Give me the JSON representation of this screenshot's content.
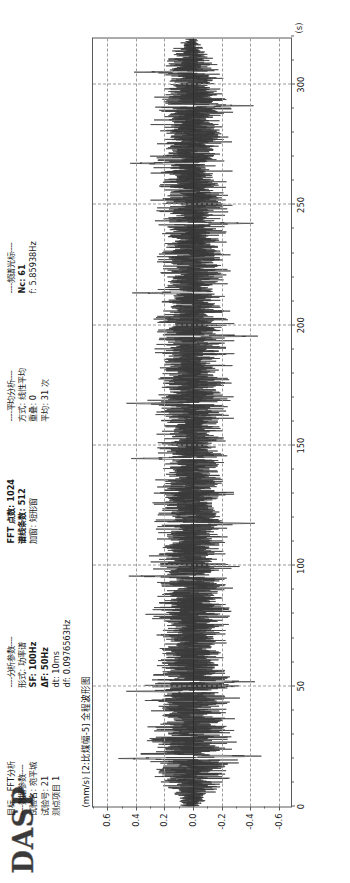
{
  "app": {
    "logo": "DASP",
    "mode_label": "目标 - FFT分析"
  },
  "params": {
    "data_section": "----数据参数----",
    "rows": [
      {
        "key": "试验名",
        "sep": ":",
        "value": "宛平城"
      },
      {
        "key": "试验号",
        "sep": ":",
        "value": "21"
      },
      {
        "key": "测点项目",
        "sep": "",
        "value": "1"
      }
    ],
    "analysis_section": "----分析参数----",
    "analysis_rows": [
      {
        "key": "形式",
        "sep": ":",
        "value": "功率谱",
        "bold": false
      },
      {
        "key": "SF",
        "sep": ":",
        "value": "100Hz",
        "bold": true
      },
      {
        "key": "ΔF",
        "sep": ":",
        "value": "50Hz",
        "bold": true
      },
      {
        "key": "dt",
        "sep": ":",
        "value": "10ms",
        "bold": false
      },
      {
        "key": "df",
        "sep": ":",
        "value": "0.0976563Hz",
        "bold": false
      },
      {
        "key": "FFT 点数",
        "sep": ":",
        "value": "1024",
        "bold": true
      },
      {
        "key": "谱线条数",
        "sep": ":",
        "value": "512",
        "bold": true
      },
      {
        "key": "加窗",
        "sep": ":",
        "value": "短形窗",
        "bold": false
      }
    ],
    "average_section": "----平均分析----",
    "average_rows": [
      {
        "key": "方式",
        "sep": ":",
        "value": "线性平均"
      },
      {
        "key": "重叠",
        "sep": ":",
        "value": "0"
      },
      {
        "key": "平均",
        "sep": ":",
        "value": "31 次"
      }
    ],
    "cursor_section": "----频谱光标----",
    "cursor_rows": [
      {
        "key": "Nc",
        "sep": ":",
        "value": "61"
      },
      {
        "key": "f",
        "sep": ":",
        "value": "5.85938Hz"
      }
    ]
  },
  "chart_data": {
    "type": "line",
    "title": "(mm/s) [2:比煤幅-5] 全程波形图",
    "xlabel": "",
    "xunit": "(s)",
    "ylabel": "",
    "yunit": "mm/s",
    "channel": "2:比煤幅-5",
    "xlim": [
      0,
      320
    ],
    "ylim": [
      -0.7,
      0.7
    ],
    "xticks": [
      0,
      50,
      100,
      150,
      200,
      250,
      300
    ],
    "xticklabels": [
      "0",
      "50",
      "100",
      "150",
      "200",
      "250",
      "300"
    ],
    "yticks": [
      -0.6,
      -0.4,
      -0.2,
      0.0,
      0.2,
      0.4,
      0.6
    ],
    "yticklabels": [
      "-0.6",
      "-0.4",
      "-0.2",
      "0.0",
      "0.2",
      "0.4",
      "0.6"
    ],
    "xminorstep": 10,
    "yminorstep": 0.1,
    "grid": true,
    "grid_style": "dashed",
    "legend": null,
    "series": [
      {
        "name": "2:比煤幅-5",
        "color": "#3b3b3b",
        "description": "dense random vibration time history, ~32000 samples at dt=10ms",
        "envelope_note": "amplitude envelope mostly within ±0.30 mm/s, occasional spikes to ±0.55",
        "envelope_x": [
          0,
          10,
          20,
          30,
          40,
          50,
          60,
          70,
          80,
          90,
          100,
          110,
          120,
          130,
          140,
          150,
          160,
          170,
          180,
          190,
          200,
          210,
          220,
          230,
          240,
          250,
          260,
          270,
          280,
          290,
          300,
          310,
          320
        ],
        "envelope_upper": [
          0.1,
          0.3,
          0.44,
          0.4,
          0.36,
          0.42,
          0.34,
          0.31,
          0.36,
          0.33,
          0.38,
          0.3,
          0.33,
          0.36,
          0.31,
          0.3,
          0.34,
          0.37,
          0.3,
          0.32,
          0.36,
          0.3,
          0.33,
          0.35,
          0.31,
          0.34,
          0.3,
          0.33,
          0.31,
          0.36,
          0.3,
          0.24,
          0.08
        ],
        "envelope_lower": [
          -0.08,
          -0.28,
          -0.42,
          -0.38,
          -0.34,
          -0.4,
          -0.33,
          -0.3,
          -0.35,
          -0.32,
          -0.36,
          -0.29,
          -0.32,
          -0.34,
          -0.3,
          -0.29,
          -0.33,
          -0.36,
          -0.29,
          -0.31,
          -0.35,
          -0.29,
          -0.32,
          -0.34,
          -0.3,
          -0.33,
          -0.29,
          -0.32,
          -0.3,
          -0.35,
          -0.29,
          -0.22,
          -0.06
        ],
        "spikes": [
          {
            "x": 20,
            "y": 0.55
          },
          {
            "x": 21,
            "y": -0.5
          },
          {
            "x": 48,
            "y": 0.47
          },
          {
            "x": 52,
            "y": -0.45
          },
          {
            "x": 96,
            "y": 0.46
          },
          {
            "x": 118,
            "y": -0.44
          },
          {
            "x": 145,
            "y": 0.45
          },
          {
            "x": 168,
            "y": 0.48
          },
          {
            "x": 196,
            "y": -0.46
          },
          {
            "x": 214,
            "y": 0.44
          },
          {
            "x": 243,
            "y": -0.43
          },
          {
            "x": 268,
            "y": 0.45
          },
          {
            "x": 292,
            "y": -0.44
          },
          {
            "x": 306,
            "y": 0.42
          }
        ]
      }
    ]
  }
}
